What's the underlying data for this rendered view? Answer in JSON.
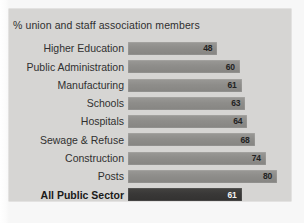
{
  "chart_data": {
    "type": "bar",
    "orientation": "horizontal",
    "title": "% union and staff association members",
    "xlabel": "",
    "ylabel": "",
    "xlim": [
      0,
      80
    ],
    "grid": false,
    "legend": null,
    "categories": [
      "Higher Education",
      "Public Administration",
      "Manufacturing",
      "Schools",
      "Hospitals",
      "Sewage & Refuse",
      "Construction",
      "Posts",
      "All Public Sector"
    ],
    "values": [
      48,
      60,
      61,
      63,
      64,
      68,
      74,
      80,
      61
    ],
    "highlight_index": 8,
    "bar_color": "#8e8d8a",
    "highlight_bar_color": "#393837",
    "panel_color": "#d6d5d3",
    "value_label_color": "#232323",
    "highlight_value_label_color": "#f2f2f2",
    "bars": [
      {
        "category": "Higher Education",
        "value": 48,
        "label": "48",
        "highlight": false
      },
      {
        "category": "Public Administration",
        "value": 60,
        "label": "60",
        "highlight": false
      },
      {
        "category": "Manufacturing",
        "value": 61,
        "label": "61",
        "highlight": false
      },
      {
        "category": "Schools",
        "value": 63,
        "label": "63",
        "highlight": false
      },
      {
        "category": "Hospitals",
        "value": 64,
        "label": "64",
        "highlight": false
      },
      {
        "category": "Sewage & Refuse",
        "value": 68,
        "label": "68",
        "highlight": false
      },
      {
        "category": "Construction",
        "value": 74,
        "label": "74",
        "highlight": false
      },
      {
        "category": "Posts",
        "value": 80,
        "label": "80",
        "highlight": false
      },
      {
        "category": "All Public Sector",
        "value": 61,
        "label": "61",
        "highlight": true
      }
    ]
  }
}
